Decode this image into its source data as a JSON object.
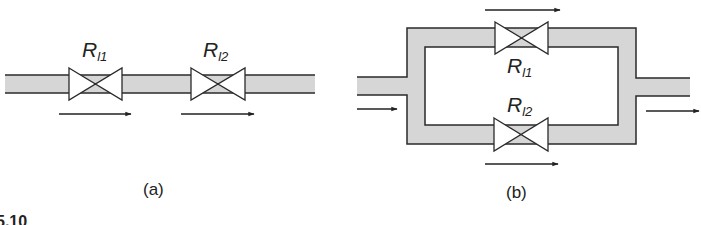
{
  "figure": {
    "label_partial": "5.10",
    "colors": {
      "pipe_fill": "#d6d6d6",
      "stroke": "#2a2a2a",
      "valve_fill": "#ffffff",
      "background": "#ffffff"
    }
  },
  "panel_a": {
    "caption": "(a)",
    "title": "Series connection",
    "valves": [
      {
        "symbol": "R",
        "subscript": "l1"
      },
      {
        "symbol": "R",
        "subscript": "l2"
      }
    ],
    "flow_arrows": [
      "right",
      "right"
    ]
  },
  "panel_b": {
    "caption": "(b)",
    "title": "Parallel connection",
    "valves": [
      {
        "symbol": "R",
        "subscript": "l1"
      },
      {
        "symbol": "R",
        "subscript": "l2"
      }
    ],
    "flow_arrows": [
      "inlet-right",
      "top-right",
      "bottom-right",
      "outlet-right"
    ]
  }
}
